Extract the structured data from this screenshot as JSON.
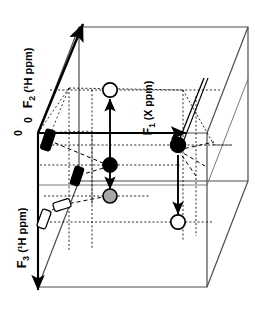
{
  "figure": {
    "type": "3d-axis-diagram",
    "background": "#ffffff",
    "ink": "#000000"
  },
  "axes": [
    {
      "id": "F2",
      "name": "F2-axis",
      "label_main": "F",
      "label_sub": "2",
      "label_units": "(¹H ppm)",
      "label_full": "F₂ (¹H ppm)",
      "direction": "up-right diagonal, arrowhead at far end",
      "rotation_deg": -90
    },
    {
      "id": "F1",
      "name": "F1-axis",
      "label_main": "F",
      "label_sub": "1",
      "label_units": "(X ppm)",
      "label_full": "F₁ (X ppm)",
      "direction": "horizontal to the right, arrowhead at far end",
      "rotation_deg": -90
    },
    {
      "id": "F3",
      "name": "F3-axis",
      "label_main": "F",
      "label_sub": "3",
      "label_units": "(¹H ppm)",
      "label_full": "F₃ (¹H ppm)",
      "direction": "vertical downward, arrowhead at bottom",
      "rotation_deg": -90
    }
  ],
  "origin_labels": [
    {
      "name": "origin-zero-upper",
      "text": "0"
    },
    {
      "name": "origin-zero-lower",
      "text": "0"
    }
  ],
  "peaks": [
    {
      "id": "p1",
      "name": "peak-open-upper",
      "style": "open",
      "fill": "#ffffff",
      "stroke": "#000000"
    },
    {
      "id": "p2",
      "name": "peak-filled-left",
      "style": "filled",
      "fill": "#000000",
      "stroke": "#000000"
    },
    {
      "id": "p3",
      "name": "peak-gray-lower",
      "style": "gray",
      "fill": "#a8a8a8",
      "stroke": "#000000"
    },
    {
      "id": "p4",
      "name": "peak-filled-right",
      "style": "filled",
      "fill": "#000000",
      "stroke": "#000000"
    },
    {
      "id": "p5",
      "name": "peak-open-lower-right",
      "style": "open",
      "fill": "#ffffff",
      "stroke": "#000000"
    }
  ],
  "projections": [
    {
      "id": "j1",
      "name": "projection-filled-upper",
      "style": "filled",
      "fill": "#000000"
    },
    {
      "id": "j2",
      "name": "projection-filled-mid",
      "style": "filled",
      "fill": "#000000"
    },
    {
      "id": "j3",
      "name": "projection-open-mid",
      "style": "open",
      "fill": "#ffffff"
    },
    {
      "id": "j4",
      "name": "projection-open-lower",
      "style": "open",
      "fill": "#ffffff"
    }
  ],
  "connectors": [
    {
      "name": "arrow-up-to-open-peak",
      "from": "peak-filled-left",
      "to": "peak-open-upper",
      "head": "up"
    },
    {
      "name": "arrow-down-to-gray-peak",
      "from": "peak-filled-left",
      "to": "peak-gray-lower",
      "head": "down"
    },
    {
      "name": "arrow-down-to-open-peak",
      "from": "peak-filled-right",
      "to": "peak-open-lower-right",
      "head": "down"
    }
  ]
}
